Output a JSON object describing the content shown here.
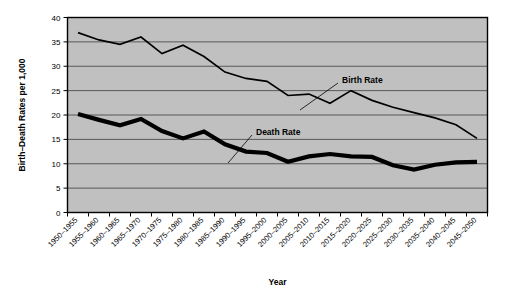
{
  "chart_data": {
    "type": "line",
    "title": "",
    "xlabel": "Year",
    "ylabel": "Birth-Death Rates per 1,000",
    "ylim": [
      0,
      40
    ],
    "yticks": [
      0,
      5,
      10,
      15,
      20,
      25,
      30,
      35,
      40
    ],
    "ytick_labels": [
      "0",
      "5",
      "10",
      "15",
      "20",
      "25",
      "30",
      "35",
      "40"
    ],
    "grid": true,
    "legend_position": "inline-annotations",
    "plot_background": "#c0c0c0",
    "line_color": "#000000",
    "categories": [
      "1950-1955",
      "1955-1960",
      "1960-1965",
      "1965-1970",
      "1970-1975",
      "1975-1980",
      "1980-1985",
      "1985-1990",
      "1990-1995",
      "1995-2000",
      "2000-2005",
      "2005-2010",
      "2010-2015",
      "2015-2020",
      "2020-2025",
      "2025-2030",
      "2030-2035",
      "2035-2040",
      "2040-2045",
      "2045-2050"
    ],
    "series": [
      {
        "name": "Birth Rate",
        "line_weight": "thin",
        "values": [
          36.9,
          35.4,
          34.5,
          36.0,
          32.6,
          34.3,
          32.0,
          28.8,
          27.5,
          26.9,
          24.0,
          24.3,
          22.4,
          25.0,
          23.0,
          21.6,
          20.5,
          19.4,
          18.0,
          15.2
        ]
      },
      {
        "name": "Death Rate",
        "line_weight": "thick",
        "values": [
          20.2,
          19.0,
          17.9,
          19.2,
          16.7,
          15.2,
          16.6,
          14.0,
          12.5,
          12.2,
          10.4,
          11.5,
          12.0,
          11.5,
          11.4,
          9.7,
          8.8,
          9.8,
          10.3,
          10.4
        ]
      }
    ],
    "annotations": [
      {
        "text": "Birth Rate",
        "target_series": "Birth Rate"
      },
      {
        "text": "Death Rate",
        "target_series": "Death Rate"
      }
    ]
  }
}
